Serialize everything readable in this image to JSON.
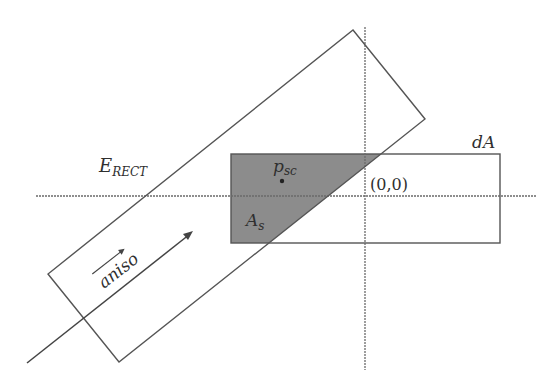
{
  "diagram": {
    "labels": {
      "erect_main": "E",
      "erect_sub": "RECT",
      "psc_main": "p",
      "psc_sub": "sc",
      "as_main": "A",
      "as_sub": "s",
      "da": "dA",
      "origin": "(0,0)",
      "aniso": "aniso"
    },
    "colors": {
      "stroke": "#555555",
      "shaded_fill": "#8c8c8c",
      "axis": "#6a6a6a",
      "text": "#2f2f2f",
      "background": "#ffffff"
    },
    "elements": [
      "horizontal-axis (dashed)",
      "vertical-axis (dashed)",
      "dA rectangle",
      "E_RECT rotated rectangle",
      "A_s shaded overlap region",
      "p_sc point",
      "aniso direction arrow"
    ]
  }
}
